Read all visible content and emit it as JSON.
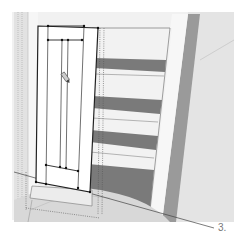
{
  "figure": {
    "step_label": "3.",
    "icons": {
      "pencil_cursor": "pencil-icon"
    },
    "colors": {
      "background": "#ffffff",
      "wall_light": "#eeeeee",
      "wall_mid": "#d6d6d6",
      "floor": "#dcdcdc",
      "shelf_dark": "#7a7a7a",
      "frame_post": "#9a9a9a",
      "door_face": "#ffffff",
      "edge": "#222222",
      "guide_line": "#555555"
    }
  }
}
